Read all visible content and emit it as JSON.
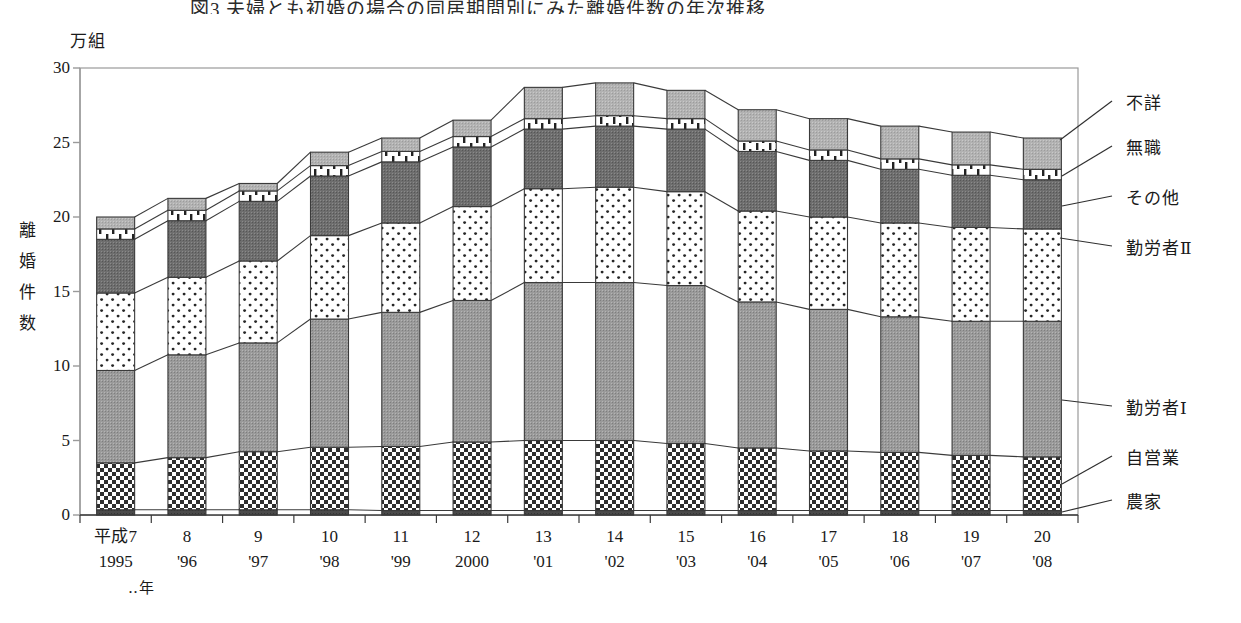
{
  "title": "図3 夫婦とも初婚の場合の同居期間別にみた離婚件数の年次推移",
  "unit_label": "万組",
  "y_axis_title_chars": [
    "離",
    "婚",
    "件",
    "数"
  ],
  "x_axis_note": "‥年",
  "legend": [
    {
      "key": "fusho",
      "label": "不詳"
    },
    {
      "key": "mushoku",
      "label": "無職"
    },
    {
      "key": "sonota",
      "label": "その他"
    },
    {
      "key": "kinrosha2",
      "label": "勤労者Ⅱ"
    },
    {
      "key": "kinrosha1",
      "label": "勤労者Ⅰ"
    },
    {
      "key": "jieigyo",
      "label": "自営業"
    },
    {
      "key": "noka",
      "label": "農家"
    }
  ],
  "chart_data": {
    "type": "area",
    "title": "図3 夫婦とも初婚の場合の同居期間別にみた離婚件数の年次推移",
    "xlabel": "‥年",
    "ylabel": "離婚件数",
    "yunit": "万組",
    "ylim": [
      0,
      30
    ],
    "yticks": [
      0,
      5,
      10,
      15,
      20,
      25,
      30
    ],
    "grid": false,
    "legend_position": "right",
    "categories": [
      {
        "era": "平成7",
        "west": "1995"
      },
      {
        "era": "8",
        "west": "'96"
      },
      {
        "era": "9",
        "west": "'97"
      },
      {
        "era": "10",
        "west": "'98"
      },
      {
        "era": "11",
        "west": "'99"
      },
      {
        "era": "12",
        "west": "2000"
      },
      {
        "era": "13",
        "west": "'01"
      },
      {
        "era": "14",
        "west": "'02"
      },
      {
        "era": "15",
        "west": "'03"
      },
      {
        "era": "16",
        "west": "'04"
      },
      {
        "era": "17",
        "west": "'05"
      },
      {
        "era": "18",
        "west": "'06"
      },
      {
        "era": "19",
        "west": "'07"
      },
      {
        "era": "20",
        "west": "'08"
      }
    ],
    "series": [
      {
        "name": "農家",
        "key": "noka",
        "values": [
          0.35,
          0.35,
          0.35,
          0.35,
          0.3,
          0.3,
          0.3,
          0.3,
          0.3,
          0.3,
          0.3,
          0.3,
          0.3,
          0.3
        ]
      },
      {
        "name": "自営業",
        "key": "jieigyo",
        "values": [
          3.15,
          3.5,
          3.9,
          4.2,
          4.3,
          4.6,
          4.7,
          4.7,
          4.5,
          4.2,
          4.0,
          3.9,
          3.7,
          3.6
        ]
      },
      {
        "name": "勤労者Ⅰ",
        "key": "kinrosha1",
        "values": [
          6.2,
          6.9,
          7.3,
          8.6,
          9.0,
          9.5,
          10.6,
          10.6,
          10.6,
          9.8,
          9.5,
          9.1,
          9.0,
          9.1
        ]
      },
      {
        "name": "勤労者Ⅱ",
        "key": "kinrosha2",
        "values": [
          5.2,
          5.2,
          5.5,
          5.6,
          6.0,
          6.3,
          6.3,
          6.4,
          6.3,
          6.1,
          6.2,
          6.3,
          6.3,
          6.2
        ]
      },
      {
        "name": "その他",
        "key": "sonota",
        "values": [
          3.6,
          3.8,
          4.0,
          4.0,
          4.1,
          4.0,
          4.0,
          4.1,
          4.2,
          4.0,
          3.8,
          3.6,
          3.5,
          3.3
        ]
      },
      {
        "name": "無職",
        "key": "mushoku",
        "values": [
          0.7,
          0.7,
          0.7,
          0.7,
          0.7,
          0.7,
          0.7,
          0.7,
          0.7,
          0.7,
          0.7,
          0.7,
          0.7,
          0.7
        ]
      },
      {
        "name": "不詳",
        "key": "fusho",
        "values": [
          0.8,
          0.8,
          0.5,
          0.9,
          0.9,
          1.1,
          2.1,
          2.2,
          1.9,
          2.1,
          2.1,
          2.2,
          2.2,
          2.1
        ]
      }
    ],
    "totals": [
      20.0,
      21.25,
      22.25,
      24.35,
      25.3,
      26.5,
      28.7,
      29.0,
      28.5,
      27.2,
      26.6,
      26.1,
      25.7,
      25.3
    ]
  },
  "colors": {
    "noka": "#555555",
    "jieigyo": "#ffffff",
    "kinrosha1": "#8e8e8e",
    "kinrosha2": "#fdfdfd",
    "sonota": "#6a6a6a",
    "mushoku": "#ffffff",
    "fusho": "#a8a8a8",
    "axis": "#9a9a9a",
    "outline": "#3a3a3a",
    "text": "#1a1a1a"
  }
}
